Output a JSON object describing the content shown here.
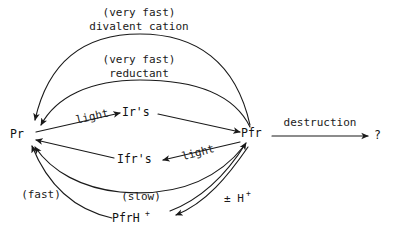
{
  "diagram": {
    "background_color": "#ffffff",
    "ink_color": "#1a1a1a",
    "nodes": [
      {
        "id": "pr",
        "label": "Pr",
        "sup": "",
        "x": 22,
        "y": 138
      },
      {
        "id": "pfr",
        "label": "Pfr",
        "sup": "",
        "x": 254,
        "y": 137
      },
      {
        "id": "irs",
        "label": "Ir's",
        "sup": "",
        "x": 138,
        "y": 116
      },
      {
        "id": "ifrs",
        "label": "Ifr's",
        "sup": "",
        "x": 137,
        "y": 163
      },
      {
        "id": "pfrh",
        "label": "PfrH",
        "sup": "+",
        "x": 137,
        "y": 222
      },
      {
        "id": "unknown",
        "label": "?",
        "sup": "",
        "x": 378,
        "y": 138
      }
    ],
    "edge_labels": [
      {
        "id": "divalent",
        "line1": "(very fast)",
        "line2": "divalent cation",
        "x": 139,
        "y": 14
      },
      {
        "id": "reductant",
        "line1": "(very fast)",
        "line2": "reductant",
        "x": 139,
        "y": 62
      },
      {
        "id": "light_top",
        "line1": "light",
        "line2": "",
        "x": 93,
        "y": 120,
        "rotate": -14
      },
      {
        "id": "light_bottom",
        "line1": "light",
        "line2": "",
        "x": 196,
        "y": 155,
        "rotate": -17
      },
      {
        "id": "destruction",
        "line1": "destruction",
        "line2": "",
        "x": 320,
        "y": 124
      },
      {
        "id": "fast",
        "line1": "(fast)",
        "line2": "",
        "x": 41,
        "y": 195
      },
      {
        "id": "slow",
        "line1": "(slow)",
        "line2": "",
        "x": 140,
        "y": 198
      },
      {
        "id": "proton",
        "line1": "± H",
        "line2": "",
        "sup": "+",
        "x": 231,
        "y": 200
      }
    ],
    "edges": [
      {
        "id": "pfr-to-pr-divalent",
        "from": "pfr",
        "to": "pr",
        "label": "divalent",
        "style": "arc-outer-top"
      },
      {
        "id": "pfr-to-pr-reductant",
        "from": "pfr",
        "to": "pr",
        "label": "reductant",
        "style": "arc-inner-top"
      },
      {
        "id": "pr-to-irs",
        "from": "pr",
        "to": "irs",
        "label": "light_top",
        "style": "straight"
      },
      {
        "id": "irs-to-pfr",
        "from": "irs",
        "to": "pfr",
        "label": "",
        "style": "straight"
      },
      {
        "id": "pfr-to-ifrs",
        "from": "pfr",
        "to": "ifrs",
        "label": "light_bottom",
        "style": "straight"
      },
      {
        "id": "ifrs-to-pr",
        "from": "ifrs",
        "to": "pr",
        "label": "",
        "style": "straight"
      },
      {
        "id": "pfr-to-unknown",
        "from": "pfr",
        "to": "unknown",
        "label": "destruction",
        "style": "straight"
      },
      {
        "id": "pfr-to-pfrh",
        "from": "pfr",
        "to": "pfrh",
        "label": "proton",
        "style": "arc-lower-right"
      },
      {
        "id": "pfrh-to-pfr",
        "from": "pfrh",
        "to": "pfr",
        "label": "proton",
        "style": "arc-lower-right-back"
      },
      {
        "id": "pfrh-to-pr-fast",
        "from": "pfrh",
        "to": "pr",
        "label": "fast",
        "style": "arc-lower-left"
      },
      {
        "id": "pfr-to-pr-slow",
        "from": "pfr",
        "to": "pr",
        "label": "slow",
        "style": "arc-bottom"
      }
    ]
  }
}
